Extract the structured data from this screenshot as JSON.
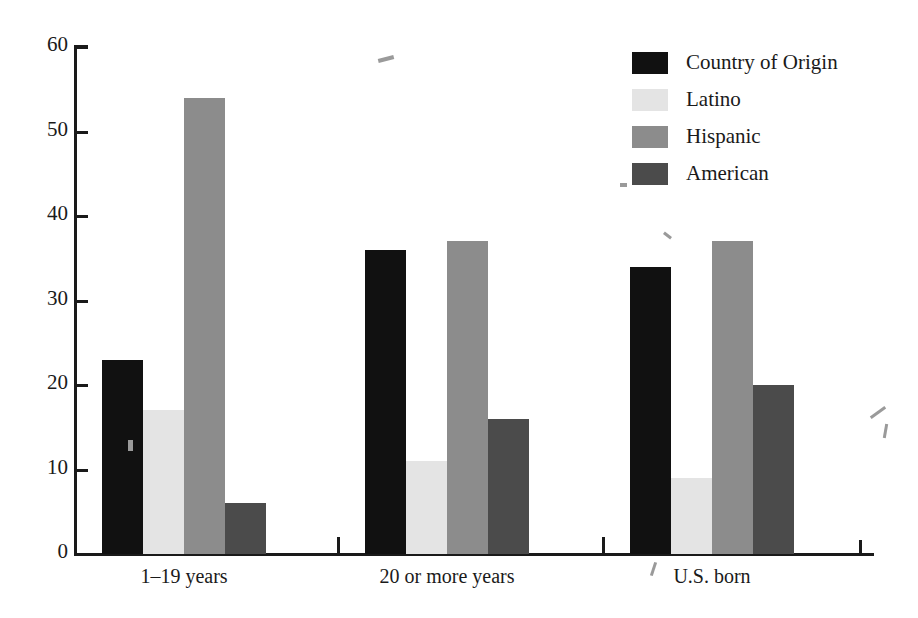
{
  "chart_data": {
    "type": "bar",
    "title": "",
    "subtitle": "",
    "xlabel": "",
    "ylabel": "",
    "ylim": [
      0,
      60
    ],
    "yticks": [
      0,
      10,
      20,
      30,
      40,
      50,
      60
    ],
    "grid": false,
    "legend_position": "top-right",
    "categories": [
      "1–19 years",
      "20 or more years",
      "U.S. born"
    ],
    "series": [
      {
        "name": "Country of Origin",
        "color": "#111111",
        "values": [
          23,
          36,
          34
        ]
      },
      {
        "name": "Latino",
        "color": "#e4e4e4",
        "values": [
          17,
          11,
          9
        ]
      },
      {
        "name": "Hispanic",
        "color": "#8c8c8c",
        "values": [
          54,
          37,
          37
        ]
      },
      {
        "name": "American",
        "color": "#4b4b4b",
        "values": [
          6,
          16,
          20
        ]
      }
    ]
  },
  "axis": {
    "y_tick_labels": [
      "60",
      "50",
      "40",
      "30",
      "20",
      "10",
      "0"
    ]
  },
  "legend": {
    "items": [
      {
        "label": "Country of Origin",
        "color": "#111111"
      },
      {
        "label": "Latino",
        "color": "#e4e4e4"
      },
      {
        "label": "Hispanic",
        "color": "#8c8c8c"
      },
      {
        "label": "American",
        "color": "#4b4b4b"
      }
    ]
  },
  "groups": [
    {
      "label": "1–19 years"
    },
    {
      "label": "20 or more years"
    },
    {
      "label": "U.S. born"
    }
  ]
}
